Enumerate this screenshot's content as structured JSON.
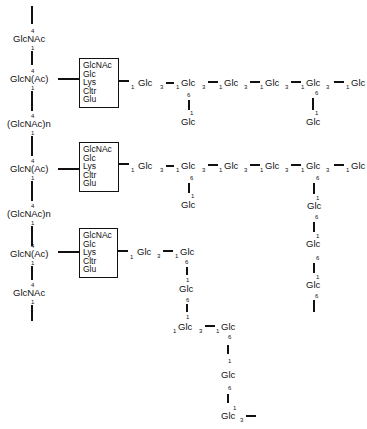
{
  "backbone": {
    "units": [
      {
        "label": "GlcNAc",
        "link_in": "4",
        "link_out": "1"
      },
      {
        "label": "GlcN(Ac)",
        "link_in": "4",
        "link_out": "1"
      },
      {
        "label": "(GlcNAc)n",
        "link_in": "4",
        "link_out": "1"
      },
      {
        "label": "GlcN(Ac)",
        "link_in": "4",
        "link_out": "1"
      },
      {
        "label": "(GlcNAc)n",
        "link_in": "4",
        "link_out": "1"
      },
      {
        "label": "GlcN(Ac)",
        "link_in": "4",
        "link_out": "1"
      },
      {
        "label": "GlcNAc",
        "link_in": "4",
        "link_out": "1"
      }
    ]
  },
  "linker_box": {
    "rows": [
      "GlcNAc",
      "Glc",
      "Lys",
      "Cltr",
      "Glu"
    ]
  },
  "chains": {
    "chain1": {
      "main": [
        "Glc",
        "Glc",
        "Glc",
        "Glc",
        "Glc",
        "Glc",
        "Glc"
      ],
      "main_link_reducing": "1",
      "main_link_nonreducing": "3",
      "branches": [
        {
          "at": 2,
          "label": "Glc",
          "from": "6",
          "to": "1"
        },
        {
          "at": 6,
          "label": "Glc",
          "from": "6",
          "to": "1"
        }
      ]
    },
    "chain2": {
      "main": [
        "Glc",
        "Glc",
        "Glc",
        "Glc",
        "Glc",
        "Glc",
        "Glc"
      ],
      "branches": [
        {
          "at": 2,
          "label": "Glc",
          "from": "6",
          "to": "1"
        }
      ],
      "pendant": [
        "Glc",
        "Glc",
        "Glc"
      ],
      "pendant_link_from": "6",
      "pendant_link_to": "1"
    },
    "chain3": {
      "main": [
        "Glc",
        "Glc"
      ],
      "down": [
        "Glc",
        "Glc",
        "Glc",
        "Glc",
        "Glc"
      ],
      "side": "Glc",
      "link3": "3",
      "link1": "1",
      "link6": "6"
    }
  }
}
